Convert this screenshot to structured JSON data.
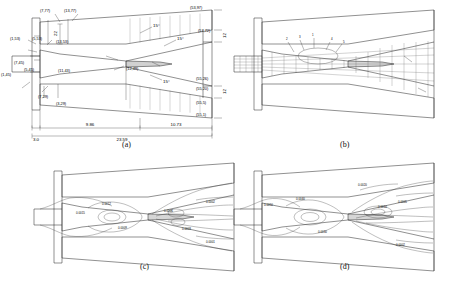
{
  "figure": {
    "panels": [
      {
        "id": "a",
        "label": "(a)",
        "type": "dimensioned-geometry"
      },
      {
        "id": "b",
        "label": "(b)",
        "type": "grid-mesh"
      },
      {
        "id": "c",
        "label": "(c)",
        "type": "contour-plot"
      },
      {
        "id": "d",
        "label": "(d)",
        "type": "contour-plot"
      }
    ]
  },
  "panel_a": {
    "label": "(a)",
    "coordinate_labels": [
      "(7,77)",
      "(13,77)",
      "(53,97)",
      "(1,53)",
      "(5,53)",
      "(13,53)",
      "(57,72)",
      "(7,45)",
      "(1,45)",
      "(5,45)",
      "(11,43)",
      "(12,49)",
      "(55,26)",
      "(55,20)",
      "(7,29)",
      "(3,29)",
      "(55,5)",
      "(55,1)"
    ],
    "angles": [
      "15°",
      "15°",
      "15°"
    ],
    "vertical_dims": [
      "22",
      "12",
      "12"
    ],
    "horizontal_dims": [
      "3.0",
      "9.86",
      "10.73",
      "23.59"
    ]
  },
  "panel_b": {
    "label": "(b)",
    "annotations": [
      "2",
      "3",
      "1",
      "4",
      "5"
    ]
  },
  "panel_c": {
    "label": "(c)",
    "contour_labels": [
      "0.0015",
      "0.0012",
      "0.0009",
      "0.0006",
      "0.0003",
      "0.0002",
      "0.0001"
    ]
  },
  "panel_d": {
    "label": "(d)",
    "contour_labels": [
      "0.0050",
      "0.0040",
      "0.0030",
      "0.0020",
      "0.0010",
      "0.0005",
      "0.0002"
    ]
  },
  "caption": {
    "text": ""
  }
}
